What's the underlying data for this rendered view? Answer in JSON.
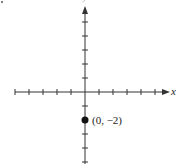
{
  "chart_data": {
    "type": "scatter",
    "title": "",
    "xlabel": "x",
    "ylabel": "y",
    "xlim": [
      -5,
      5
    ],
    "ylim": [
      -5,
      6
    ],
    "grid": false,
    "x_ticks": [
      -5,
      -4,
      -3,
      -2,
      -1,
      1,
      2,
      3,
      4,
      5
    ],
    "y_ticks": [
      -5,
      -4,
      -3,
      -2,
      -1,
      1,
      2,
      3,
      4,
      5
    ],
    "series": [
      {
        "name": "point",
        "x": [
          0
        ],
        "y": [
          -2
        ],
        "labels": [
          "(0, −2)"
        ]
      }
    ]
  },
  "labels": {
    "x_axis": "x",
    "y_axis": "y",
    "point": "(0, −2)"
  },
  "colors": {
    "axis": "#333333",
    "point": "#111111"
  }
}
